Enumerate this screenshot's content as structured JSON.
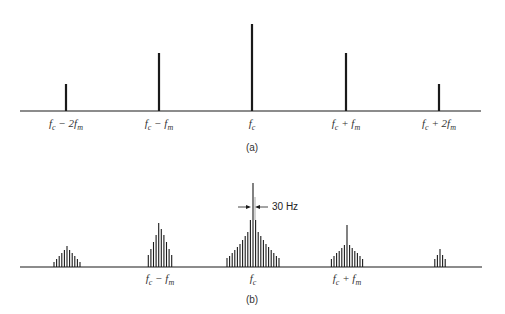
{
  "panel_a": {
    "caption": "(a)",
    "baseline": {
      "y": 111,
      "x1": 20,
      "x2": 481
    },
    "lines": [
      {
        "x": 66,
        "top": 84
      },
      {
        "x": 159,
        "top": 53
      },
      {
        "x": 252,
        "top": 24
      },
      {
        "x": 346,
        "top": 53
      },
      {
        "x": 439,
        "top": 84
      }
    ],
    "labels": [
      {
        "x": 66,
        "main": "f",
        "sub": "c",
        "rest": " − 2f",
        "rsub": "m"
      },
      {
        "x": 159,
        "main": "f",
        "sub": "c",
        "rest": " − f",
        "rsub": "m"
      },
      {
        "x": 252,
        "main": "f",
        "sub": "c",
        "rest": "",
        "rsub": ""
      },
      {
        "x": 346,
        "main": "f",
        "sub": "c",
        "rest": " + f",
        "rsub": "m"
      },
      {
        "x": 439,
        "main": "f",
        "sub": "c",
        "rest": " + 2f",
        "rsub": "m"
      }
    ],
    "label_y": 117,
    "caption_y": 142
  },
  "panel_b": {
    "caption": "(b)",
    "baseline": {
      "y": 267,
      "x1": 20,
      "x2": 482
    },
    "annotation": "30 Hz",
    "clusters": [
      {
        "cx": 67,
        "tops": [
          262,
          259,
          256,
          253,
          250,
          246,
          250,
          253,
          256,
          259,
          262
        ]
      },
      {
        "cx": 160,
        "tops": [
          255,
          249,
          242,
          235,
          223,
          229,
          235,
          242,
          249,
          255
        ]
      },
      {
        "cx": 253,
        "tops": [
          258,
          256,
          253,
          250,
          247,
          244,
          240,
          236,
          232,
          220,
          183,
          220,
          232,
          236,
          240,
          244,
          247,
          250,
          253,
          256,
          258
        ]
      },
      {
        "cx": 347,
        "tops": [
          259,
          256,
          253,
          251,
          248,
          245,
          225,
          245,
          248,
          251,
          253,
          256,
          259
        ]
      },
      {
        "cx": 440,
        "tops": [
          259,
          255,
          249,
          255,
          259
        ]
      }
    ],
    "spacing": 2.6,
    "labels": [
      {
        "x": 160,
        "main": "f",
        "sub": "c",
        "rest": " − f",
        "rsub": "m"
      },
      {
        "x": 253,
        "main": "f",
        "sub": "c",
        "rest": "",
        "rsub": ""
      },
      {
        "x": 347,
        "main": "f",
        "sub": "c",
        "rest": " + f",
        "rsub": "m"
      }
    ],
    "label_y": 272,
    "caption_y": 294
  }
}
